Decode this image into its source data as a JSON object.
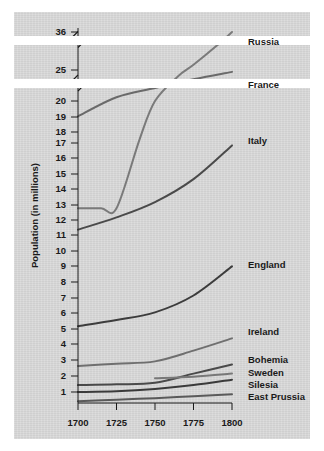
{
  "figure": {
    "background_color": "#ffffff",
    "panel_color": "#d8d8d8",
    "axis_color": "#1a1a1a"
  },
  "chart_data": {
    "type": "line",
    "title": "",
    "xlabel": "",
    "ylabel": "Population (in millions)",
    "x": [
      1700,
      1725,
      1750,
      1775,
      1800
    ],
    "xlim": [
      1700,
      1800
    ],
    "xticks": [
      1700,
      1725,
      1750,
      1775,
      1800
    ],
    "xtick_labels": [
      "1700",
      "1725",
      "1750",
      "1775",
      "1800"
    ],
    "yticks": [
      1,
      2,
      3,
      4,
      5,
      6,
      7,
      8,
      9,
      10,
      11,
      12,
      13,
      14,
      15,
      16,
      17,
      18,
      19,
      20,
      25,
      36
    ],
    "ytick_labels": [
      "1",
      "2",
      "3",
      "4",
      "5",
      "6",
      "7",
      "8",
      "9",
      "10",
      "11",
      "12",
      "13",
      "14",
      "15",
      "16",
      "17",
      "18",
      "19",
      "20",
      "25",
      "36"
    ],
    "y_axis_broken": true,
    "y_axis_breaks": [
      "between 20 and 25",
      "between 25 and 36"
    ],
    "grid": false,
    "legend_position": "right-inline",
    "series": [
      {
        "name": "Russia",
        "color": "#7a7a7a",
        "label": "Russia",
        "points": [
          [
            1700,
            13.0
          ],
          [
            1715,
            13.0
          ],
          [
            1725,
            13.0
          ],
          [
            1740,
            17.5
          ],
          [
            1750,
            20.0
          ],
          [
            1765,
            24.0
          ],
          [
            1775,
            26.5
          ],
          [
            1790,
            32.0
          ],
          [
            1800,
            36.0
          ]
        ]
      },
      {
        "name": "France",
        "color": "#6a6a6a",
        "label": "France",
        "points": [
          [
            1700,
            19.0
          ],
          [
            1725,
            20.6
          ],
          [
            1750,
            22.1
          ],
          [
            1775,
            23.5
          ],
          [
            1800,
            24.7
          ]
        ]
      },
      {
        "name": "Italy",
        "color": "#4a4a4a",
        "label": "Italy",
        "points": [
          [
            1700,
            11.6
          ],
          [
            1725,
            12.4
          ],
          [
            1750,
            13.4
          ],
          [
            1775,
            14.9
          ],
          [
            1800,
            17.1
          ]
        ]
      },
      {
        "name": "England",
        "color": "#3c3c3c",
        "label": "England",
        "points": [
          [
            1700,
            5.3
          ],
          [
            1725,
            5.7
          ],
          [
            1750,
            6.2
          ],
          [
            1775,
            7.3
          ],
          [
            1800,
            9.2
          ]
        ]
      },
      {
        "name": "Ireland",
        "color": "#6f6f6f",
        "label": "Ireland",
        "points": [
          [
            1700,
            2.7
          ],
          [
            1725,
            2.85
          ],
          [
            1750,
            3.0
          ],
          [
            1775,
            3.7
          ],
          [
            1800,
            4.5
          ]
        ]
      },
      {
        "name": "Bohemia",
        "color": "#4a4a4a",
        "label": "Bohemia",
        "points": [
          [
            1700,
            1.45
          ],
          [
            1725,
            1.5
          ],
          [
            1750,
            1.6
          ],
          [
            1775,
            2.2
          ],
          [
            1800,
            2.8
          ]
        ]
      },
      {
        "name": "Sweden",
        "color": "#787878",
        "label": "Sweden",
        "points": [
          [
            1750,
            1.9
          ],
          [
            1775,
            2.0
          ],
          [
            1800,
            2.2
          ]
        ]
      },
      {
        "name": "Silesia",
        "color": "#3a3a3a",
        "label": "Silesia",
        "points": [
          [
            1700,
            1.0
          ],
          [
            1725,
            1.05
          ],
          [
            1750,
            1.2
          ],
          [
            1775,
            1.45
          ],
          [
            1800,
            1.8
          ]
        ]
      },
      {
        "name": "East Prussia",
        "color": "#5a5a5a",
        "label": "East Prussia",
        "points": [
          [
            1700,
            0.4
          ],
          [
            1725,
            0.5
          ],
          [
            1750,
            0.6
          ],
          [
            1775,
            0.72
          ],
          [
            1800,
            0.85
          ]
        ]
      }
    ]
  }
}
